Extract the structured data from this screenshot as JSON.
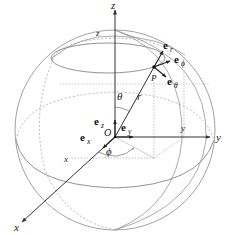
{
  "figure": {
    "colors": {
      "background": "#ffffff",
      "axis": "#333333",
      "sphere": "#8a8a8a",
      "dashed": "#9a9a9a",
      "text": "#222222"
    },
    "labels": {
      "origin": "O",
      "point": "P",
      "radius": "r",
      "theta": "θ",
      "phi": "ϕ",
      "axis_x": "x",
      "axis_y": "y",
      "axis_z": "z",
      "inner_x": "x",
      "inner_y": "y",
      "inner_z": "z"
    },
    "unit_vectors": {
      "ex": {
        "base": "e",
        "sub": "x"
      },
      "ey": {
        "base": "e",
        "sub": "y"
      },
      "ez": {
        "base": "e",
        "sub": "z"
      },
      "er": {
        "base": "e",
        "sub": "r"
      },
      "ephi": {
        "base": "e",
        "sub": "ϕ"
      },
      "etheta": {
        "base": "e",
        "sub": "θ"
      }
    }
  }
}
